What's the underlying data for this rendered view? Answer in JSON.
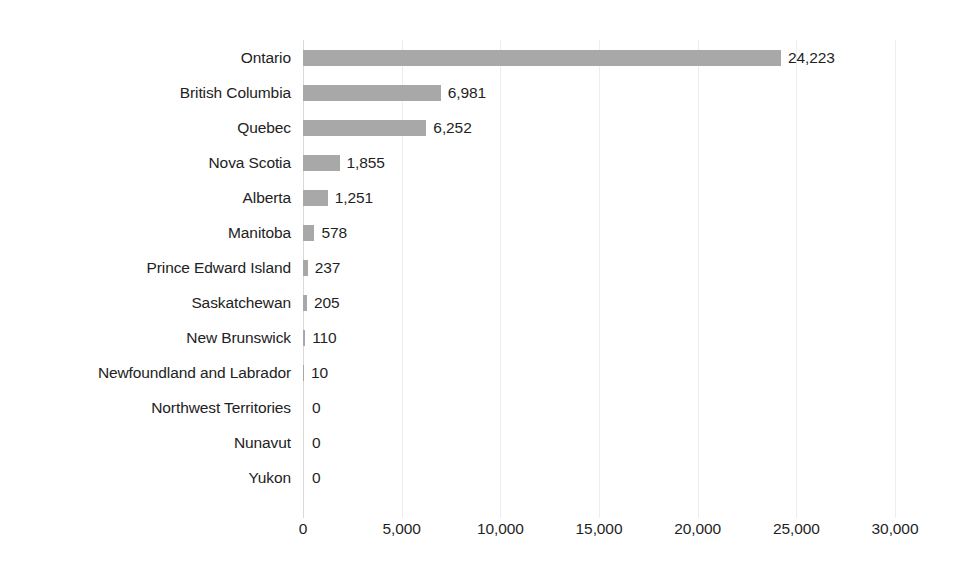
{
  "chart_data": {
    "type": "bar",
    "orientation": "horizontal",
    "title": "",
    "subtitle": "",
    "xlabel": "",
    "ylabel": "",
    "xlim": [
      0,
      30000
    ],
    "ylim": null,
    "grid": true,
    "grid_axis": "x",
    "legend": null,
    "legend_position": "none",
    "categories": [
      "Ontario",
      "British Columbia",
      "Quebec",
      "Nova Scotia",
      "Alberta",
      "Manitoba",
      "Prince Edward Island",
      "Saskatchewan",
      "New Brunswick",
      "Newfoundland and Labrador",
      "Northwest Territories",
      "Nunavut",
      "Yukon"
    ],
    "values": [
      24223,
      6981,
      6252,
      1855,
      1251,
      578,
      237,
      205,
      110,
      10,
      0,
      0,
      0
    ],
    "value_labels": [
      "24,223",
      "6,981",
      "6,252",
      "1,855",
      "1,251",
      "578",
      "237",
      "205",
      "110",
      "10",
      "0",
      "0",
      "0"
    ],
    "xticks": [
      0,
      5000,
      10000,
      15000,
      20000,
      25000,
      30000
    ],
    "xtick_labels": [
      "0",
      "5,000",
      "10,000",
      "15,000",
      "20,000",
      "25,000",
      "30,000"
    ],
    "bar_color": "#a8a8a8",
    "background_color": "#ffffff",
    "gridline_color": "#ededed",
    "axis_color": "#d9d9d9",
    "label_color": "#222222"
  }
}
